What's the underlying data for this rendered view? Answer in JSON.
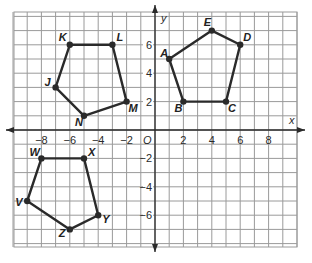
{
  "diagram": {
    "type": "coordinate-plane",
    "axes": {
      "x_label": "x",
      "y_label": "y",
      "origin_label": "O"
    },
    "x_ticks": [
      "-8",
      "-6",
      "-4",
      "-2",
      "2",
      "4",
      "6",
      "8"
    ],
    "y_ticks": [
      "6",
      "4",
      "2",
      "-2",
      "-4",
      "-6"
    ],
    "grid": {
      "xmin": -10,
      "xmax": 10,
      "ymin": -8,
      "ymax": 8,
      "step": 1
    }
  },
  "polygons": [
    {
      "name": "ABCDE",
      "vertices": [
        {
          "label": "A",
          "x": 1,
          "y": 5
        },
        {
          "label": "B",
          "x": 2,
          "y": 2
        },
        {
          "label": "C",
          "x": 5,
          "y": 2
        },
        {
          "label": "D",
          "x": 6,
          "y": 6
        },
        {
          "label": "E",
          "x": 4,
          "y": 7
        }
      ]
    },
    {
      "name": "JKLMN",
      "vertices": [
        {
          "label": "J",
          "x": -7,
          "y": 3
        },
        {
          "label": "K",
          "x": -6,
          "y": 6
        },
        {
          "label": "L",
          "x": -3,
          "y": 6
        },
        {
          "label": "M",
          "x": -2,
          "y": 2
        },
        {
          "label": "N",
          "x": -5,
          "y": 1
        }
      ]
    },
    {
      "name": "VWXYZ",
      "vertices": [
        {
          "label": "V",
          "x": -9,
          "y": -5
        },
        {
          "label": "W",
          "x": -8,
          "y": -2
        },
        {
          "label": "X",
          "x": -5,
          "y": -2
        },
        {
          "label": "Y",
          "x": -4,
          "y": -6
        },
        {
          "label": "Z",
          "x": -6,
          "y": -7
        }
      ]
    }
  ]
}
